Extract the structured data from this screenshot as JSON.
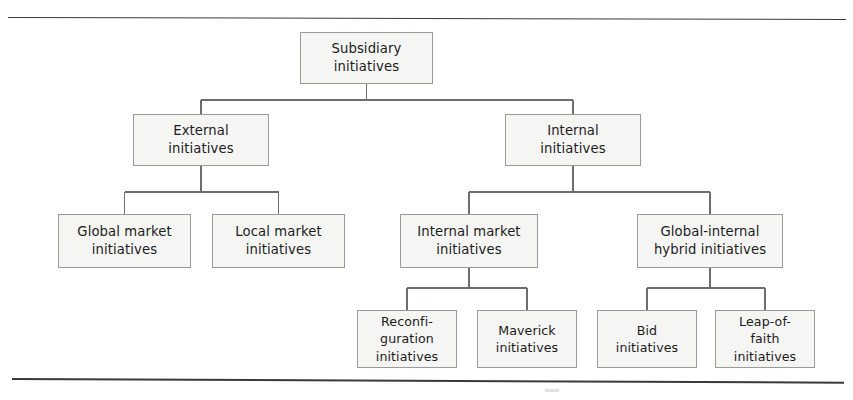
{
  "figure": {
    "type": "hierarchy-tree-diagram",
    "border_rule_color": "#3a3a3a",
    "node_fill": "#f5f5f3",
    "node_border": "#9a9a9a",
    "connector_color": "#6e6e6e"
  },
  "nodes": {
    "root": "Subsidiary\ninitiatives",
    "external": "External\ninitiatives",
    "internal": "Internal\ninitiatives",
    "global_market": "Global market\ninitiatives",
    "local_market": "Local market\ninitiatives",
    "internal_market": "Internal market\ninitiatives",
    "global_internal_hybrid": "Global-internal\nhybrid initiatives",
    "reconfiguration": "Reconfi-\nguration\ninitiatives",
    "maverick": "Maverick\ninitiatives",
    "bid": "Bid\ninitiatives",
    "leap_of_faith": "Leap-of-\nfaith\ninitiatives"
  },
  "tree": {
    "root": "Subsidiary initiatives",
    "children": [
      {
        "label": "External initiatives",
        "children": [
          {
            "label": "Global market initiatives"
          },
          {
            "label": "Local market initiatives"
          }
        ]
      },
      {
        "label": "Internal initiatives",
        "children": [
          {
            "label": "Internal market initiatives",
            "children": [
              {
                "label": "Reconfiguration initiatives"
              },
              {
                "label": "Maverick initiatives"
              }
            ]
          },
          {
            "label": "Global-internal hybrid initiatives",
            "children": [
              {
                "label": "Bid initiatives"
              },
              {
                "label": "Leap-of-faith initiatives"
              }
            ]
          }
        ]
      }
    ]
  }
}
